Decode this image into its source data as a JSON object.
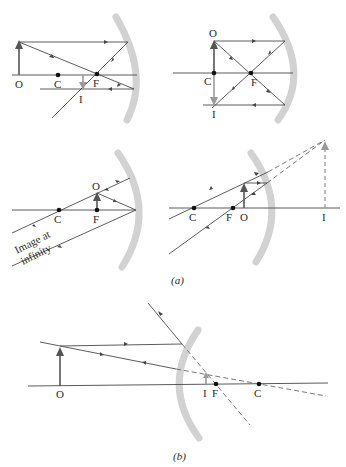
{
  "figure": {
    "caption_a": "(a)",
    "caption_b": "(b)",
    "panels": [
      {
        "id": "a1",
        "mirror": "concave",
        "case": "object beyond C",
        "labels": {
          "object": "O",
          "center": "C",
          "focus": "F",
          "image": "I"
        }
      },
      {
        "id": "a2",
        "mirror": "concave",
        "case": "object at C",
        "labels": {
          "object": "O",
          "center": "C",
          "focus": "F",
          "image": "I"
        }
      },
      {
        "id": "a3",
        "mirror": "concave",
        "case": "object at F",
        "labels": {
          "object": "O",
          "center": "C",
          "focus": "F"
        },
        "annotation_line1": "Image at",
        "annotation_line2": "infinity"
      },
      {
        "id": "a4",
        "mirror": "concave",
        "case": "object inside F (virtual image)",
        "labels": {
          "object": "O",
          "center": "C",
          "focus": "F",
          "image": "I"
        }
      },
      {
        "id": "b",
        "mirror": "convex",
        "case": "virtual image behind convex mirror",
        "labels": {
          "object": "O",
          "center": "C",
          "focus": "F",
          "image": "I"
        }
      }
    ]
  },
  "colors": {
    "ray": "#4a4a4a",
    "mirror": "#d2d2d2",
    "object_arrow": "#555555",
    "image_arrow": "#9a9a9a",
    "point": "#111111"
  }
}
